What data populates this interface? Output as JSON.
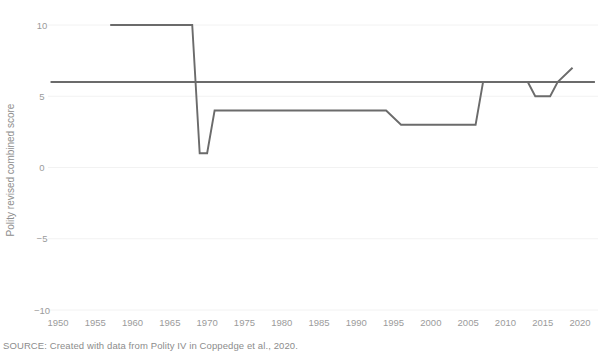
{
  "chart_data": {
    "type": "line",
    "title": "",
    "xlabel": "",
    "ylabel": "Polity revised combined score",
    "xlim": [
      1950,
      2020
    ],
    "ylim": [
      -10,
      10
    ],
    "grid": false,
    "legend": "none",
    "x_ticks": [
      1950,
      1955,
      1960,
      1965,
      1970,
      1975,
      1980,
      1985,
      1990,
      1995,
      2000,
      2005,
      2010,
      2015,
      2020
    ],
    "y_ticks": [
      10,
      5,
      0,
      -5,
      -10
    ],
    "series": [
      {
        "name": "Polity revised combined score",
        "color": "#6b6b6b",
        "points": [
          [
            1957,
            10
          ],
          [
            1968,
            10
          ],
          [
            1969,
            1
          ],
          [
            1970,
            1
          ],
          [
            1971,
            4
          ],
          [
            1994,
            4
          ],
          [
            1996,
            3
          ],
          [
            2006,
            3
          ],
          [
            2007,
            6
          ],
          [
            2013,
            6
          ],
          [
            2014,
            5
          ],
          [
            2016,
            5
          ],
          [
            2017,
            6
          ],
          [
            2019,
            7
          ]
        ]
      },
      {
        "name": "reference-level",
        "color": "#6b6b6b",
        "points": [
          [
            1949,
            6
          ],
          [
            2022,
            6
          ]
        ]
      }
    ],
    "annotations": []
  },
  "labels": {
    "y_axis_title": "Polity revised combined score",
    "y_tick_10": "10",
    "y_tick_5": "5",
    "y_tick_0": "0",
    "y_tick_neg5": "−5",
    "y_tick_neg10": "−10",
    "x_tick_1950": "1950",
    "x_tick_1955": "1955",
    "x_tick_1960": "1960",
    "x_tick_1965": "1965",
    "x_tick_1970": "1970",
    "x_tick_1975": "1975",
    "x_tick_1980": "1980",
    "x_tick_1985": "1985",
    "x_tick_1990": "1990",
    "x_tick_1995": "1995",
    "x_tick_2000": "2000",
    "x_tick_2005": "2005",
    "x_tick_2010": "2010",
    "x_tick_2015": "2015",
    "x_tick_2020": "2020"
  },
  "footer": {
    "source_note": "SOURCE: Created with data from Polity IV in Coppedge et al., 2020."
  },
  "colors": {
    "line": "#6b6b6b",
    "tick_text": "#9b9b9b",
    "axis_title": "#8e8e8e",
    "gridline": "#f2f2f2",
    "background": "#ffffff",
    "source_text": "#8c8c8c"
  }
}
